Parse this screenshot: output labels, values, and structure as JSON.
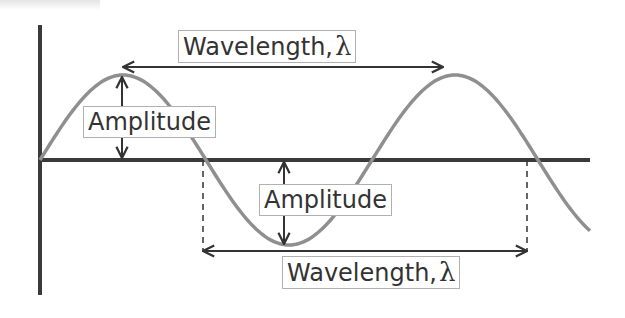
{
  "diagram": {
    "colors": {
      "wave": "#8f8f8f",
      "axis": "#333333",
      "arrow": "#333333",
      "label_border": "#b0b0b0"
    },
    "labels": {
      "wavelength_top": {
        "text": "Wavelength,",
        "symbol": "λ"
      },
      "amplitude_left": {
        "text": "Amplitude"
      },
      "amplitude_mid": {
        "text": "Amplitude"
      },
      "wavelength_bottom": {
        "text": "Wavelength,",
        "symbol": "λ"
      }
    },
    "geometry": {
      "origin": [
        40,
        160
      ],
      "amplitude_px": 85,
      "wavelength_px": 324,
      "peaks_x": [
        123,
        443
      ],
      "trough_x": 284,
      "zero_crossings_x": [
        40,
        203,
        365,
        527
      ]
    }
  }
}
